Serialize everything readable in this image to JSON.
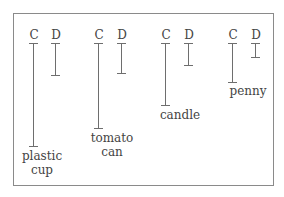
{
  "title_fragment": "",
  "legend": {
    "c_label": "C",
    "d_label": "D"
  },
  "items": [
    {
      "name": "plastic cup",
      "line1": "plastic",
      "line2": "cup",
      "C": 103,
      "D": 32
    },
    {
      "name": "tomato can",
      "line1": "tomato",
      "line2": "can",
      "C": 85,
      "D": 30
    },
    {
      "name": "candle",
      "line1": "candle",
      "line2": "",
      "C": 62,
      "D": 22
    },
    {
      "name": "penny",
      "line1": "penny",
      "line2": "",
      "C": 39,
      "D": 14
    }
  ],
  "colors": {
    "line": "#6e6e6e",
    "frame": "#8a8a8a",
    "text": "#444444"
  }
}
